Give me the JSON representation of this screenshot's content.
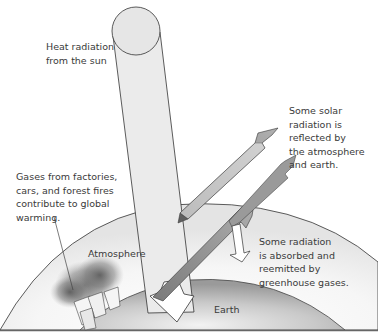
{
  "diagram": {
    "labels": {
      "sun": "Heat radiation\nfrom the sun",
      "reflected": "Some solar\nradiation is\nreflected by\nthe atmosphere\nand earth.",
      "gases": "Gases from factories,\ncars, and forest fires\ncontribute to global\nwarming.",
      "atmosphere": "Atmosphere",
      "absorbed": "Some radiation\nis absorbed and\nreemitted by\ngreenhouse gases.",
      "earth": "Earth"
    },
    "colors": {
      "background": "#ffffff",
      "sun_fill": "#e6e6e6",
      "beam_fill": "#e9e9e9",
      "arrow_dark": "#8a8a8a",
      "earth_fill": "#b5b5b5",
      "atmosphere_fill": "#f3f3f3",
      "smoke": "#6a6a6a",
      "stroke": "#333333"
    }
  }
}
